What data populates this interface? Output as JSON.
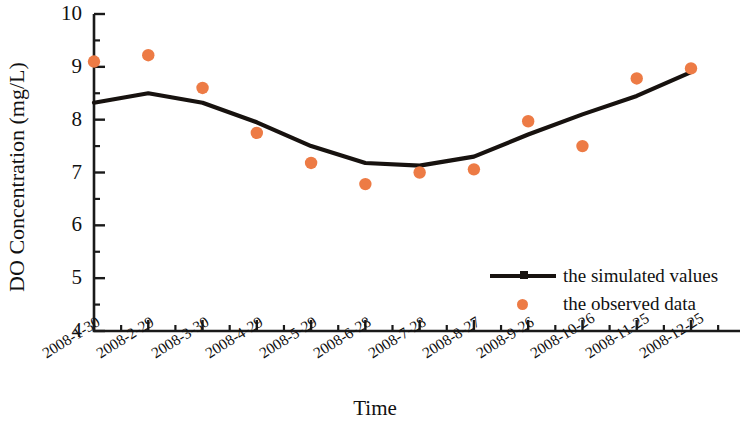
{
  "chart_data": {
    "type": "line",
    "title": "",
    "xlabel": "Time",
    "ylabel": "DO Concentration (mg/L)",
    "ylim": [
      4,
      10
    ],
    "yticks": [
      4,
      5,
      6,
      7,
      8,
      9,
      10
    ],
    "minor_yticks": [
      4.5,
      5.5,
      6.5,
      7.5,
      8.5,
      9.5
    ],
    "grid": false,
    "legend_position": "lower-right-inside",
    "categories": [
      "2008-1-30",
      "2008-2-29",
      "2008-3-30",
      "2008-4-29",
      "2008-5-29",
      "2008-6-28",
      "2008-7-28",
      "2008-8-27",
      "2008-9-26",
      "2008-10-26",
      "2008-11-25",
      "2008-12-25"
    ],
    "series": [
      {
        "name": "the simulated values",
        "type": "line",
        "color": "#17120f",
        "values": [
          8.32,
          8.5,
          8.32,
          7.95,
          7.5,
          7.18,
          7.13,
          7.3,
          7.72,
          8.1,
          8.45,
          8.9
        ]
      },
      {
        "name": "the observed data",
        "type": "scatter",
        "color": "#ed7b45",
        "values": [
          9.1,
          9.22,
          8.6,
          7.75,
          7.18,
          6.78,
          7.0,
          7.06,
          7.97,
          7.5,
          8.78,
          8.97
        ]
      }
    ]
  },
  "axis": {
    "y_tick_labels": [
      "10",
      "9",
      "8",
      "7",
      "6",
      "5",
      "4"
    ],
    "y_title": "DO Concentration (mg/L)",
    "x_title": "Time"
  },
  "legend": {
    "items": [
      {
        "label": "the simulated values",
        "marker": "line-with-square",
        "color": "#17120f"
      },
      {
        "label": "the observed data",
        "marker": "dot",
        "color": "#ed7b45"
      }
    ]
  },
  "colors": {
    "observed": "#ed7b45",
    "simulated": "#17120f",
    "axis": "#1a1a1a",
    "background": "#ffffff"
  }
}
